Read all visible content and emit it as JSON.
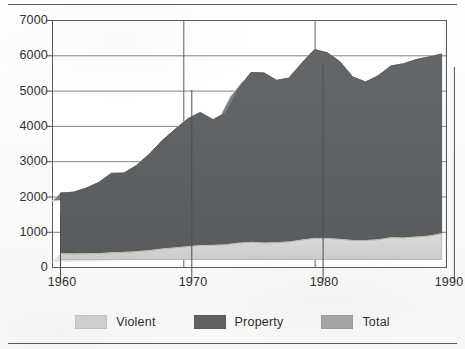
{
  "chart_data": {
    "type": "area",
    "subtype": "stacked-3d-area",
    "title": "",
    "xlabel": "",
    "ylabel": "",
    "xlim": [
      1960,
      1991
    ],
    "ylim": [
      0,
      7000
    ],
    "ytick_labels": [
      "7000",
      "6000",
      "5000",
      "4000",
      "3000",
      "2000",
      "1000",
      "0"
    ],
    "ytick_values": [
      7000,
      6000,
      5000,
      4000,
      3000,
      2000,
      1000,
      0
    ],
    "xtick_labels": [
      "1960",
      "1970",
      "1980",
      "1990"
    ],
    "xtick_values": [
      1960,
      1970,
      1980,
      1990
    ],
    "grid": true,
    "legend_position": "bottom",
    "x": [
      1960,
      1961,
      1962,
      1963,
      1964,
      1965,
      1966,
      1967,
      1968,
      1969,
      1970,
      1971,
      1972,
      1973,
      1974,
      1975,
      1976,
      1977,
      1978,
      1979,
      1980,
      1981,
      1982,
      1983,
      1984,
      1985,
      1986,
      1987,
      1988,
      1989,
      1990
    ],
    "series": [
      {
        "name": "Violent",
        "color": "#d0d0ce",
        "values": [
          161,
          158,
          162,
          168,
          191,
          200,
          220,
          253,
          298,
          329,
          364,
          396,
          401,
          417,
          461,
          488,
          468,
          476,
          498,
          549,
          597,
          594,
          571,
          538,
          539,
          557,
          618,
          610,
          637,
          663,
          732
        ]
      },
      {
        "name": "Property",
        "color": "#5d6164",
        "values": [
          1726,
          1747,
          1857,
          2012,
          2248,
          2249,
          2451,
          2737,
          3071,
          3351,
          3621,
          3769,
          3561,
          3737,
          4389,
          4811,
          4820,
          4602,
          4643,
          5017,
          5353,
          5264,
          5033,
          4637,
          4492,
          4651,
          4863,
          4940,
          5027,
          5078,
          5089
        ]
      },
      {
        "name": "Total",
        "color": "#a5a7a6",
        "values": [
          1887,
          1906,
          2020,
          2180,
          2439,
          2449,
          2671,
          2990,
          3370,
          3680,
          3985,
          4165,
          3961,
          4154,
          4850,
          5299,
          5287,
          5078,
          5140,
          5566,
          5950,
          5858,
          5604,
          5175,
          5031,
          5207,
          5480,
          5550,
          5664,
          5741,
          5820
        ]
      }
    ]
  },
  "axes": {
    "y_ticks": [
      {
        "label": "7000",
        "value": 7000
      },
      {
        "label": "6000",
        "value": 6000
      },
      {
        "label": "5000",
        "value": 5000
      },
      {
        "label": "4000",
        "value": 4000
      },
      {
        "label": "3000",
        "value": 3000
      },
      {
        "label": "2000",
        "value": 2000
      },
      {
        "label": "1000",
        "value": 1000
      },
      {
        "label": "0",
        "value": 0
      }
    ],
    "x_ticks": [
      {
        "label": "1960",
        "value": 1960
      },
      {
        "label": "1970",
        "value": 1970
      },
      {
        "label": "1980",
        "value": 1980
      },
      {
        "label": "1990",
        "value": 1990
      }
    ]
  },
  "legend": {
    "items": [
      {
        "label": "Violent",
        "color": "#d0d0ce"
      },
      {
        "label": "Property",
        "color": "#5d6164"
      },
      {
        "label": "Total",
        "color": "#a5a7a6"
      }
    ]
  },
  "colors": {
    "violent": "#d0d0ce",
    "property": "#5d6164",
    "total": "#a5a7a6",
    "axis": "#3f4446",
    "grid": "#6d7274",
    "text": "#2d2f31",
    "rule": "#555a5c",
    "background": "#ffffff"
  }
}
